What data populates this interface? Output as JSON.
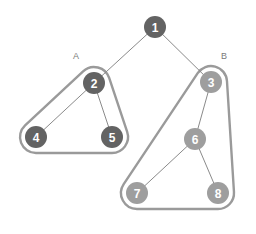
{
  "diagram": {
    "canvas": {
      "width": 256,
      "height": 234,
      "background": "#ffffff"
    },
    "colors": {
      "node_dark": "#636363",
      "node_light": "#9e9e9e",
      "node_text": "#ffffff",
      "edge": "#8a8a8a",
      "hull": "#9a9a9a",
      "cluster_label": "#7a7a7a"
    },
    "style": {
      "node_radius": 11,
      "edge_width": 1,
      "hull_width": 2.4,
      "hull_offset": 16
    },
    "nodes": [
      {
        "id": "1",
        "label": "1",
        "x": 155,
        "y": 27,
        "shade": "dark",
        "cluster": ""
      },
      {
        "id": "2",
        "label": "2",
        "x": 94,
        "y": 83,
        "shade": "dark",
        "cluster": "A"
      },
      {
        "id": "3",
        "label": "3",
        "x": 211,
        "y": 82,
        "shade": "light",
        "cluster": "B"
      },
      {
        "id": "4",
        "label": "4",
        "x": 36,
        "y": 137,
        "shade": "dark",
        "cluster": "A"
      },
      {
        "id": "5",
        "label": "5",
        "x": 112,
        "y": 137,
        "shade": "dark",
        "cluster": "A"
      },
      {
        "id": "6",
        "label": "6",
        "x": 195,
        "y": 139,
        "shade": "light",
        "cluster": "B"
      },
      {
        "id": "7",
        "label": "7",
        "x": 137,
        "y": 193,
        "shade": "light",
        "cluster": "B"
      },
      {
        "id": "8",
        "label": "8",
        "x": 218,
        "y": 193,
        "shade": "light",
        "cluster": "B"
      }
    ],
    "edges": [
      {
        "source": "1",
        "target": "2"
      },
      {
        "source": "1",
        "target": "3"
      },
      {
        "source": "2",
        "target": "4"
      },
      {
        "source": "2",
        "target": "5"
      },
      {
        "source": "3",
        "target": "6"
      },
      {
        "source": "6",
        "target": "7"
      },
      {
        "source": "6",
        "target": "8"
      }
    ],
    "clusters": [
      {
        "id": "A",
        "label": "A",
        "label_x": 76,
        "label_y": 56,
        "members": [
          "2",
          "4",
          "5"
        ]
      },
      {
        "id": "B",
        "label": "B",
        "label_x": 224,
        "label_y": 56,
        "members": [
          "3",
          "6",
          "7",
          "8"
        ]
      }
    ]
  }
}
